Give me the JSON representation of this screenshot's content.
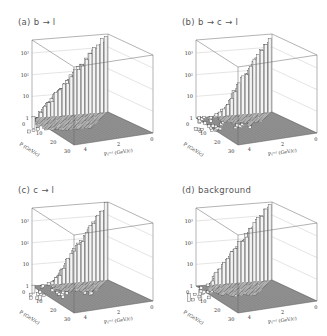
{
  "figure": {
    "panels": [
      {
        "id": "a",
        "title": "(a)  b → l",
        "max_exp": 3,
        "spread": 1.0
      },
      {
        "id": "b",
        "title": "(b)  b → c → l",
        "max_exp": 3,
        "spread": 0.55
      },
      {
        "id": "c",
        "title": "(c)  c → l",
        "max_exp": 3,
        "spread": 0.6
      },
      {
        "id": "d",
        "title": "(d)  background",
        "max_exp": 3,
        "spread": 0.8
      }
    ],
    "z_ticks": [
      "1",
      "10",
      "10²",
      "10³"
    ],
    "p_ticks": [
      "0",
      "10",
      "20",
      "30"
    ],
    "ptrel_ticks": [
      "4",
      "2",
      "0"
    ],
    "p_label": "P (GeV/c)",
    "ptrel_label": "Pₜʳᵉˡ (GeV/c)"
  },
  "chart_data": [
    {
      "type": "lego3d",
      "title": "(a) b → l",
      "xlabel": "P (GeV/c)",
      "ylabel": "P_T^rel (GeV/c)",
      "zlabel": "entries (log)",
      "x_range": [
        0,
        30
      ],
      "y_range": [
        0,
        5
      ],
      "z_ticks": [
        "1",
        "10",
        "10^2",
        "10^3"
      ],
      "z_scale": "log",
      "peak": {
        "P": 0,
        "P_T_rel": 0,
        "approx": 1000
      }
    },
    {
      "type": "lego3d",
      "title": "(b) b → c → l",
      "xlabel": "P (GeV/c)",
      "ylabel": "P_T^rel (GeV/c)",
      "zlabel": "entries (log)",
      "x_range": [
        0,
        30
      ],
      "y_range": [
        0,
        5
      ],
      "z_ticks": [
        "1",
        "10",
        "10^2",
        "10^3"
      ],
      "z_scale": "log",
      "peak": {
        "P": 0,
        "P_T_rel": 0,
        "approx": 1000
      }
    },
    {
      "type": "lego3d",
      "title": "(c) c → l",
      "xlabel": "P (GeV/c)",
      "ylabel": "P_T^rel (GeV/c)",
      "zlabel": "entries (log)",
      "x_range": [
        0,
        30
      ],
      "y_range": [
        0,
        5
      ],
      "z_ticks": [
        "1",
        "10",
        "10^2",
        "10^3"
      ],
      "z_scale": "log",
      "peak": {
        "P": 0,
        "P_T_rel": 0,
        "approx": 1000
      }
    },
    {
      "type": "lego3d",
      "title": "(d) background",
      "xlabel": "P (GeV/c)",
      "ylabel": "P_T^rel (GeV/c)",
      "zlabel": "entries (log)",
      "x_range": [
        0,
        30
      ],
      "y_range": [
        0,
        5
      ],
      "z_ticks": [
        "1",
        "10",
        "10^2",
        "10^3"
      ],
      "z_scale": "log",
      "peak": {
        "P": 0,
        "P_T_rel": 0,
        "approx": 1000
      }
    }
  ]
}
